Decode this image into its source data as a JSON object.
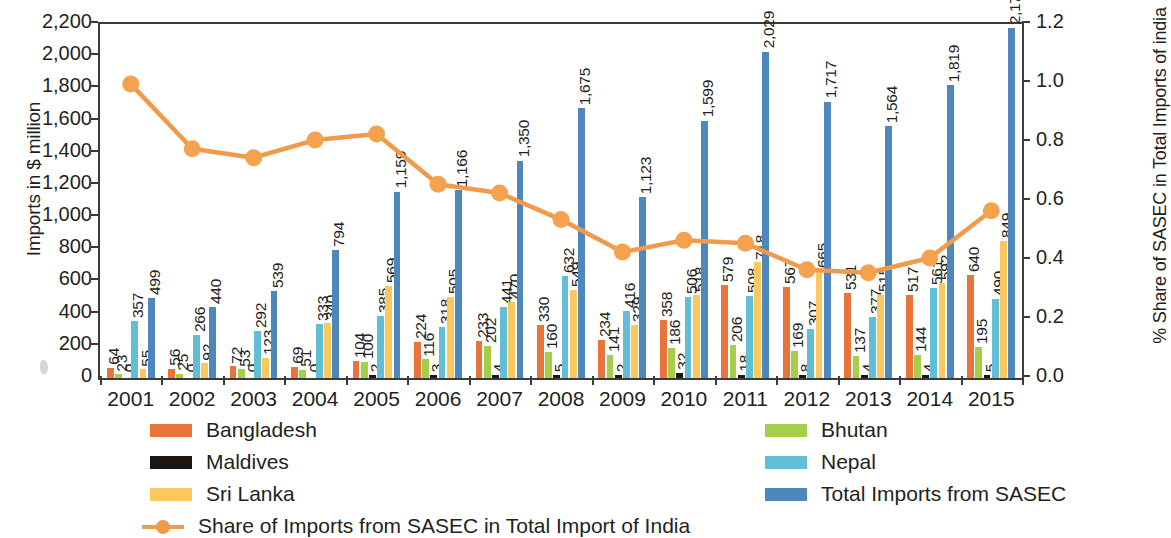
{
  "chart_data": {
    "type": "bar",
    "title": "",
    "xlabel": "",
    "ylabel": "Imports in $ million",
    "y2label": "% Share of SASEC in Total Imports of india",
    "ylim": [
      0,
      2200
    ],
    "y2lim": [
      0.0,
      1.2
    ],
    "yticks": [
      "0",
      "200",
      "400",
      "600",
      "800",
      "1,000",
      "1,200",
      "1,400",
      "1,600",
      "1,800",
      "2,000",
      "2,200"
    ],
    "y2ticks": [
      "0.0",
      "0.2",
      "0.4",
      "0.6",
      "0.8",
      "1.0",
      "1.2"
    ],
    "grid": false,
    "legend_position": "bottom",
    "categories": [
      "2001",
      "2002",
      "2003",
      "2004",
      "2005",
      "2006",
      "2007",
      "2008",
      "2009",
      "2010",
      "2011",
      "2012",
      "2013",
      "2014",
      "2015"
    ],
    "series": [
      {
        "name": "Bangladesh",
        "color": "#E8743B",
        "axis": "left",
        "values": [
          64,
          56,
          72,
          69,
          104,
          224,
          233,
          330,
          234,
          358,
          579,
          567,
          531,
          517,
          640
        ]
      },
      {
        "name": "Bhutan",
        "color": "#A6CE48",
        "axis": "left",
        "values": [
          23,
          25,
          53,
          51,
          100,
          116,
          202,
          160,
          141,
          186,
          206,
          169,
          137,
          144,
          195
        ]
      },
      {
        "name": "Maldives",
        "color": "#1C1613",
        "axis": "left",
        "values": [
          0,
          0,
          0,
          0,
          2,
          3,
          4,
          5,
          2,
          32,
          18,
          8,
          4,
          4,
          5
        ]
      },
      {
        "name": "Nepal",
        "color": "#62BED4",
        "axis": "left",
        "values": [
          357,
          266,
          292,
          333,
          385,
          318,
          441,
          632,
          416,
          506,
          508,
          307,
          377,
          561,
          490
        ]
      },
      {
        "name": "Sri Lanka",
        "color": "#FBC860",
        "axis": "left",
        "values": [
          55,
          92,
          123,
          340,
          569,
          505,
          470,
          549,
          329,
          518,
          718,
          665,
          515,
          592,
          849
        ]
      },
      {
        "name": "Total Imports from SASEC",
        "color": "#4E87BC",
        "axis": "left",
        "values": [
          499,
          440,
          539,
          794,
          1159,
          1166,
          1350,
          1675,
          1123,
          1599,
          2029,
          1717,
          1564,
          1819,
          2178
        ]
      }
    ],
    "line_series": {
      "name": "Share of Imports from SASEC in Total Import of India",
      "color": "#F09A4B",
      "axis": "right",
      "values": [
        0.99,
        0.77,
        0.74,
        0.8,
        0.82,
        0.65,
        0.62,
        0.53,
        0.42,
        0.46,
        0.45,
        0.36,
        0.35,
        0.4,
        0.56
      ]
    }
  },
  "legend": {
    "items": [
      {
        "label": "Bangladesh",
        "color": "#E8743B",
        "type": "bar"
      },
      {
        "label": "Bhutan",
        "color": "#A6CE48",
        "type": "bar"
      },
      {
        "label": "Maldives",
        "color": "#1C1613",
        "type": "bar"
      },
      {
        "label": "Nepal",
        "color": "#62BED4",
        "type": "bar"
      },
      {
        "label": "Sri Lanka",
        "color": "#FBC860",
        "type": "bar"
      },
      {
        "label": "Total Imports from SASEC",
        "color": "#4E87BC",
        "type": "bar"
      },
      {
        "label": "Share of Imports from SASEC in Total Import of India",
        "color": "#F09A4B",
        "type": "line"
      }
    ]
  }
}
